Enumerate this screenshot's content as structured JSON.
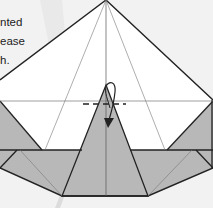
{
  "caption": {
    "lines": [
      "nted",
      "ease",
      "h."
    ]
  },
  "diagram": {
    "type": "origami-fold-step",
    "symbols": [
      "valley-fold-line",
      "fold-arrow"
    ],
    "colors": {
      "paper_white": "#ffffff",
      "paper_colored": "#b8b8b8",
      "line": "#222222",
      "crease": "#777777",
      "background": "#f2f2f2"
    }
  }
}
